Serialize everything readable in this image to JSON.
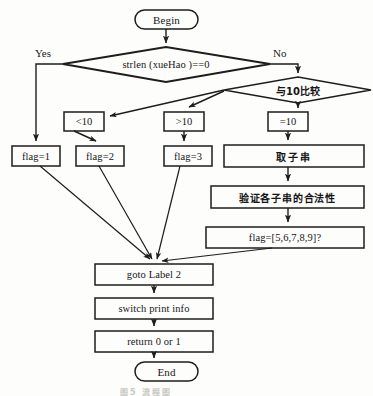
{
  "diagram": {
    "title_caption": "图5    流程图",
    "colors": {
      "background": "#fdfdfb",
      "stroke": "#1d1d1d",
      "text": "#161616",
      "caption": "#c9c9c4"
    },
    "terminators": [
      {
        "id": "begin",
        "label": "Begin"
      },
      {
        "id": "end",
        "label": "End"
      }
    ],
    "decisions": [
      {
        "id": "strlen-check",
        "label": "strlen (xueHao )==0"
      },
      {
        "id": "compare-10",
        "label": "与10比较"
      }
    ],
    "branch_labels": [
      {
        "id": "yes",
        "label": "Yes"
      },
      {
        "id": "no",
        "label": "No"
      }
    ],
    "condition_boxes": [
      {
        "id": "lt10",
        "label": "<10"
      },
      {
        "id": "gt10",
        "label": ">10"
      },
      {
        "id": "eq10",
        "label": "=10"
      }
    ],
    "flag_boxes": [
      {
        "id": "flag1",
        "label": "flag=1"
      },
      {
        "id": "flag2",
        "label": "flag=2"
      },
      {
        "id": "flag3",
        "label": "flag=3"
      }
    ],
    "process_boxes": [
      {
        "id": "substring",
        "label": "取子串"
      },
      {
        "id": "validate",
        "label": "验证各子串的合法性"
      },
      {
        "id": "flag-set",
        "label": "flag=[5,6,7,8,9]?"
      }
    ],
    "tail_boxes": [
      {
        "id": "goto-label",
        "label": "goto Label  2"
      },
      {
        "id": "switch-print",
        "label": "switch  print info"
      },
      {
        "id": "return-value",
        "label": "return 0 or  1"
      }
    ]
  }
}
